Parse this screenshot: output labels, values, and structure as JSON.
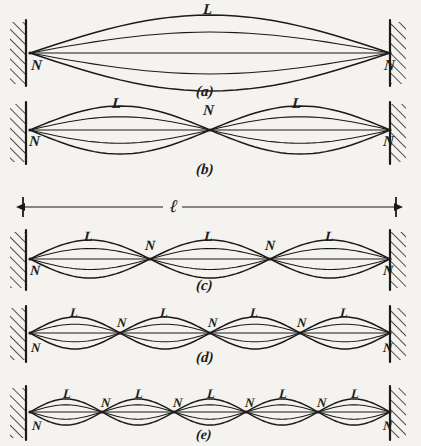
{
  "figure": {
    "background_color": "#f4f3ef",
    "ink_color": "#1b1a18",
    "width": 421,
    "height": 446,
    "length_label": "ℓ",
    "node_label": "N",
    "loop_label": "L",
    "dimension": {
      "label": "ℓ",
      "x_start": 23,
      "x_end": 396,
      "y": 207,
      "label_x": 170,
      "label_y": 197
    },
    "panels": [
      {
        "caption": "(a)",
        "caption_x": 196,
        "caption_y": 84,
        "loops": 1,
        "axis_y": 53,
        "amplitude": 38,
        "x_left": 30,
        "x_right": 390,
        "caption_size": 15,
        "label_size": 15,
        "nodes": [
          {
            "text": "N",
            "x": 31,
            "y": 58,
            "anchor": "start"
          },
          {
            "text": "N",
            "x": 384,
            "y": 58,
            "anchor": "start"
          }
        ],
        "antinodes": [
          {
            "text": "L",
            "x": 203,
            "y": 2
          }
        ]
      },
      {
        "caption": "(b)",
        "caption_x": 196,
        "caption_y": 162,
        "loops": 2,
        "axis_y": 130,
        "amplitude": 24,
        "x_left": 30,
        "x_right": 390,
        "caption_size": 15,
        "label_size": 15,
        "nodes": [
          {
            "text": "N",
            "x": 29,
            "y": 134,
            "anchor": "start"
          },
          {
            "text": "N",
            "x": 203,
            "y": 103,
            "anchor": "start"
          },
          {
            "text": "N",
            "x": 383,
            "y": 134,
            "anchor": "start"
          }
        ],
        "antinodes": [
          {
            "text": "L",
            "x": 112,
            "y": 96
          },
          {
            "text": "L",
            "x": 292,
            "y": 96
          }
        ]
      },
      {
        "caption": "(c)",
        "caption_x": 196,
        "caption_y": 278,
        "loops": 3,
        "axis_y": 259,
        "amplitude": 19,
        "x_left": 30,
        "x_right": 390,
        "caption_size": 15,
        "label_size": 14,
        "nodes": [
          {
            "text": "N",
            "x": 30,
            "y": 264,
            "anchor": "start"
          },
          {
            "text": "N",
            "x": 145,
            "y": 239,
            "anchor": "start"
          },
          {
            "text": "N",
            "x": 265,
            "y": 239,
            "anchor": "start"
          },
          {
            "text": "N",
            "x": 383,
            "y": 264,
            "anchor": "start"
          }
        ],
        "antinodes": [
          {
            "text": "L",
            "x": 84,
            "y": 230
          },
          {
            "text": "L",
            "x": 204,
            "y": 230
          },
          {
            "text": "L",
            "x": 325,
            "y": 230
          }
        ]
      },
      {
        "caption": "(d)",
        "caption_x": 196,
        "caption_y": 350,
        "loops": 4,
        "axis_y": 333,
        "amplitude": 16,
        "x_left": 30,
        "x_right": 390,
        "caption_size": 15,
        "label_size": 13,
        "nodes": [
          {
            "text": "N",
            "x": 31,
            "y": 341,
            "anchor": "start"
          },
          {
            "text": "N",
            "x": 117,
            "y": 316,
            "anchor": "start"
          },
          {
            "text": "N",
            "x": 208,
            "y": 316,
            "anchor": "start"
          },
          {
            "text": "N",
            "x": 297,
            "y": 316,
            "anchor": "start"
          },
          {
            "text": "N",
            "x": 383,
            "y": 341,
            "anchor": "start"
          }
        ],
        "antinodes": [
          {
            "text": "L",
            "x": 70,
            "y": 306
          },
          {
            "text": "L",
            "x": 160,
            "y": 306
          },
          {
            "text": "L",
            "x": 250,
            "y": 306
          },
          {
            "text": "L",
            "x": 340,
            "y": 306
          }
        ]
      },
      {
        "caption": "(e)",
        "caption_x": 196,
        "caption_y": 428,
        "loops": 5,
        "axis_y": 412,
        "amplitude": 13,
        "x_left": 30,
        "x_right": 390,
        "caption_size": 14,
        "label_size": 13,
        "nodes": [
          {
            "text": "N",
            "x": 32,
            "y": 419,
            "anchor": "start"
          },
          {
            "text": "N",
            "x": 101,
            "y": 396,
            "anchor": "start"
          },
          {
            "text": "N",
            "x": 173,
            "y": 396,
            "anchor": "start"
          },
          {
            "text": "N",
            "x": 245,
            "y": 396,
            "anchor": "start"
          },
          {
            "text": "N",
            "x": 317,
            "y": 396,
            "anchor": "start"
          },
          {
            "text": "N",
            "x": 383,
            "y": 419,
            "anchor": "start"
          }
        ],
        "antinodes": [
          {
            "text": "L",
            "x": 63,
            "y": 387
          },
          {
            "text": "L",
            "x": 135,
            "y": 387
          },
          {
            "text": "L",
            "x": 207,
            "y": 387
          },
          {
            "text": "L",
            "x": 279,
            "y": 387
          },
          {
            "text": "L",
            "x": 351,
            "y": 387
          }
        ]
      }
    ],
    "walls": [
      {
        "side": "left",
        "x": 26,
        "y_top": 22,
        "height": 62
      },
      {
        "side": "right",
        "x": 390,
        "y_top": 22,
        "height": 62
      },
      {
        "side": "left",
        "x": 26,
        "y_top": 104,
        "height": 58
      },
      {
        "side": "right",
        "x": 390,
        "y_top": 104,
        "height": 58
      },
      {
        "side": "left",
        "x": 26,
        "y_top": 232,
        "height": 56
      },
      {
        "side": "right",
        "x": 390,
        "y_top": 232,
        "height": 56
      },
      {
        "side": "left",
        "x": 26,
        "y_top": 308,
        "height": 52
      },
      {
        "side": "right",
        "x": 390,
        "y_top": 308,
        "height": 52
      },
      {
        "side": "left",
        "x": 26,
        "y_top": 388,
        "height": 50
      },
      {
        "side": "right",
        "x": 390,
        "y_top": 388,
        "height": 50
      }
    ]
  }
}
